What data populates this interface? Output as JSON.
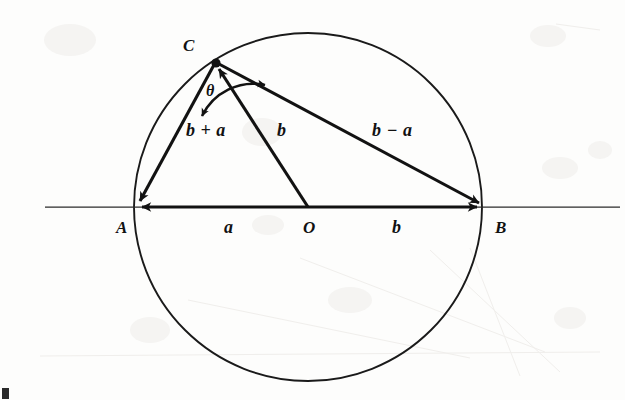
{
  "figure": {
    "type": "geometry-diagram",
    "background_color": "#fdfdfc",
    "stroke_color": "#121212",
    "canvas": {
      "width": 625,
      "height": 400
    }
  },
  "geometry": {
    "circle": {
      "center_x": 308,
      "center_y": 207,
      "radius": 174
    },
    "axis_line": {
      "x1": 45,
      "y1": 207,
      "x2": 620,
      "y2": 207
    },
    "points": {
      "A": {
        "x": 136,
        "y": 207
      },
      "B": {
        "x": 483,
        "y": 207
      },
      "O": {
        "x": 308,
        "y": 207
      },
      "C": {
        "x": 215,
        "y": 62
      }
    },
    "vectors": [
      {
        "name": "a",
        "from": "O",
        "to": "A",
        "arrow_at": "A"
      },
      {
        "name": "b",
        "from": "O",
        "to": "B",
        "arrow_at": "B"
      },
      {
        "name": "b",
        "from": "O",
        "to": "C",
        "arrow_at": "C"
      },
      {
        "name": "b + a",
        "from": "C",
        "to": "A",
        "arrow_at": "A"
      },
      {
        "name": "b - a",
        "from": "C",
        "to": "B",
        "arrow_at": "B"
      }
    ],
    "angle_arc": {
      "vertex": "C",
      "label": "theta",
      "double_headed": true,
      "radius": 57
    }
  },
  "labels": {
    "point_A": "A",
    "point_B": "B",
    "point_O": "O",
    "point_C": "C",
    "vector_a": "a",
    "vector_b_left": "b",
    "vector_b_right": "b",
    "vector_b_plus_a": "b + a",
    "vector_b_minus_a": "b − a",
    "angle_theta": "θ"
  },
  "colors": {
    "ink": "#121212",
    "paper": "#fdfdfc",
    "thin_rule": "#2b2b2b",
    "smudge": "#e9e7e4"
  }
}
